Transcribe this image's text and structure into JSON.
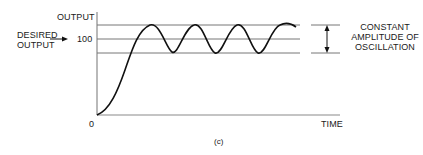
{
  "diagram": {
    "y_axis_label": "OUTPUT",
    "x_axis_label": "TIME",
    "origin_label": "0",
    "desired_output_label_line1": "DESIRED",
    "desired_output_label_line2": "OUTPUT",
    "setpoint_value": "100",
    "annotation_line1": "CONSTANT",
    "annotation_line2": "AMPLITUDE OF",
    "annotation_line3": "OSCILLATION",
    "caption": "(c)",
    "colors": {
      "curve": "#111111",
      "guide_lines": "#777777",
      "axes": "#888888",
      "text": "#1a1a1a"
    }
  }
}
